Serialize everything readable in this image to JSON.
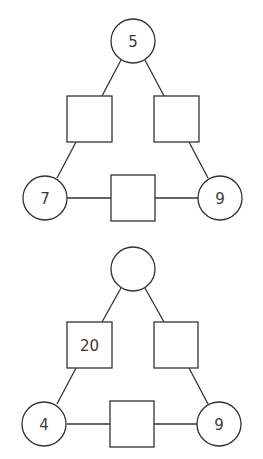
{
  "colors": {
    "stroke": "#333333",
    "text": "#3a3a3a",
    "background": "#ffffff"
  },
  "diagrams": [
    {
      "name": "triangle-puzzle-1",
      "top_circle": "5",
      "left_square": "",
      "right_square": "",
      "bottom_left_circle": "7",
      "bottom_square": "",
      "bottom_right_circle": "9"
    },
    {
      "name": "triangle-puzzle-2",
      "top_circle": "",
      "left_square": "20",
      "right_square": "",
      "bottom_left_circle": "4",
      "bottom_square": "",
      "bottom_right_circle": "9"
    }
  ]
}
